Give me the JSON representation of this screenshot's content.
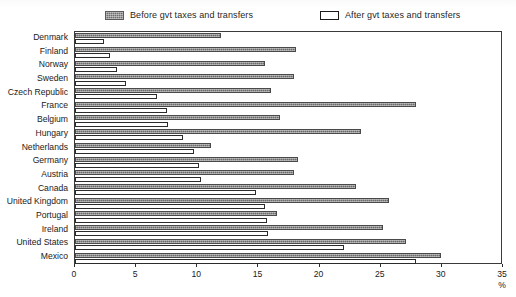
{
  "legend": {
    "before": {
      "label": "Before gvt taxes and transfers",
      "swatch": "filled-gray-swatch",
      "color": "#6b6b6b"
    },
    "after": {
      "label": "After gvt taxes and transfers",
      "swatch": "empty-white-swatch",
      "color": "#ffffff"
    }
  },
  "axis": {
    "unit": "%",
    "ticks": [
      "0",
      "5",
      "10",
      "15",
      "20",
      "25",
      "30",
      "35"
    ]
  },
  "chart_data": {
    "type": "bar",
    "orientation": "horizontal",
    "title": "",
    "xlabel": "%",
    "ylabel": "",
    "xlim": [
      0,
      35
    ],
    "xticks": [
      0,
      5,
      10,
      15,
      20,
      25,
      30,
      35
    ],
    "grid": false,
    "legend_position": "top",
    "categories": [
      "Denmark",
      "Finland",
      "Norway",
      "Sweden",
      "Czech Republic",
      "France",
      "Belgium",
      "Hungary",
      "Netherlands",
      "Germany",
      "Austria",
      "Canada",
      "United Kingdom",
      "Portugal",
      "Ireland",
      "United States",
      "Mexico"
    ],
    "series": [
      {
        "name": "Before gvt taxes and transfers",
        "color": "#6b6b6b",
        "values": [
          11.9,
          18.1,
          15.5,
          17.9,
          16.0,
          27.9,
          16.8,
          23.4,
          11.1,
          18.2,
          17.9,
          23.0,
          25.7,
          16.5,
          25.2,
          27.1,
          29.9
        ]
      },
      {
        "name": "After gvt taxes and transfers",
        "color": "#ffffff",
        "values": [
          2.4,
          2.9,
          3.4,
          4.2,
          6.7,
          7.5,
          7.6,
          8.8,
          9.7,
          10.1,
          10.3,
          14.8,
          15.5,
          15.7,
          15.8,
          22.0,
          27.9
        ]
      }
    ]
  }
}
